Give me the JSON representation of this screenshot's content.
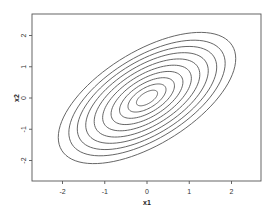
{
  "chart_data": {
    "type": "contour",
    "title": "",
    "xlabel": "x1",
    "ylabel": "x2",
    "xlim": [
      -2.7,
      2.7
    ],
    "ylim": [
      -2.7,
      2.7
    ],
    "x_ticks": [
      -2,
      -1,
      0,
      1,
      2
    ],
    "y_ticks": [
      -2,
      -1,
      0,
      1,
      2
    ],
    "x_tick_labels": [
      "-2",
      "-1",
      "0",
      "1",
      "2"
    ],
    "y_tick_labels": [
      "-2",
      "-1",
      "0",
      "1",
      "2"
    ],
    "grid": false,
    "legend": null,
    "center": [
      0,
      0
    ],
    "sigma_x": 1,
    "sigma_y": 1,
    "correlation": 0.6,
    "contour_levels_mahalanobis": [
      0.25,
      0.45,
      0.65,
      0.85,
      1.05,
      1.25,
      1.45,
      1.65,
      1.85,
      2.1
    ],
    "line_color": "#555555"
  }
}
